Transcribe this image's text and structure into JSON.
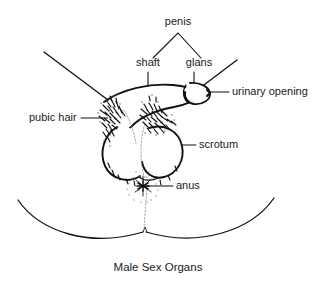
{
  "figure": {
    "caption": "Male Sex Organs",
    "background_color": "#ffffff",
    "line_color": "#111111",
    "text_color": "#1a1a1a",
    "width": 333,
    "height": 288
  },
  "labels": {
    "penis": "penis",
    "shaft": "shaft",
    "glans": "glans",
    "urinary_opening": "urinary opening",
    "pubic_hair": "pubic hair",
    "scrotum": "scrotum",
    "anus": "anus"
  },
  "annotations": [
    {
      "id": "penis",
      "text": "penis",
      "text_x": 178,
      "text_y": 22,
      "anchor": "middle",
      "leader_type": "bracket",
      "note": "caret bracket pointing down to shaft and glans"
    },
    {
      "id": "shaft",
      "text": "shaft",
      "text_x": 148,
      "text_y": 63,
      "anchor": "middle",
      "leader_type": "vertical-tick"
    },
    {
      "id": "glans",
      "text": "glans",
      "text_x": 199,
      "text_y": 63,
      "anchor": "middle",
      "leader_type": "vertical-tick"
    },
    {
      "id": "urinary-opening",
      "text": "urinary opening",
      "text_x": 232,
      "text_y": 92,
      "anchor": "start",
      "leader_type": "horizontal"
    },
    {
      "id": "pubic-hair",
      "text": "pubic hair",
      "text_x": 29,
      "text_y": 118,
      "anchor": "start",
      "leader_type": "horizontal"
    },
    {
      "id": "scrotum",
      "text": "scrotum",
      "text_x": 199,
      "text_y": 145,
      "anchor": "start",
      "leader_type": "horizontal"
    },
    {
      "id": "anus",
      "text": "anus",
      "text_x": 176,
      "text_y": 186,
      "anchor": "start",
      "leader_type": "horizontal"
    }
  ],
  "anatomy_parts": [
    "penis shaft",
    "glans",
    "urinary opening",
    "pubic hair",
    "scrotum",
    "anus",
    "inner thighs"
  ]
}
